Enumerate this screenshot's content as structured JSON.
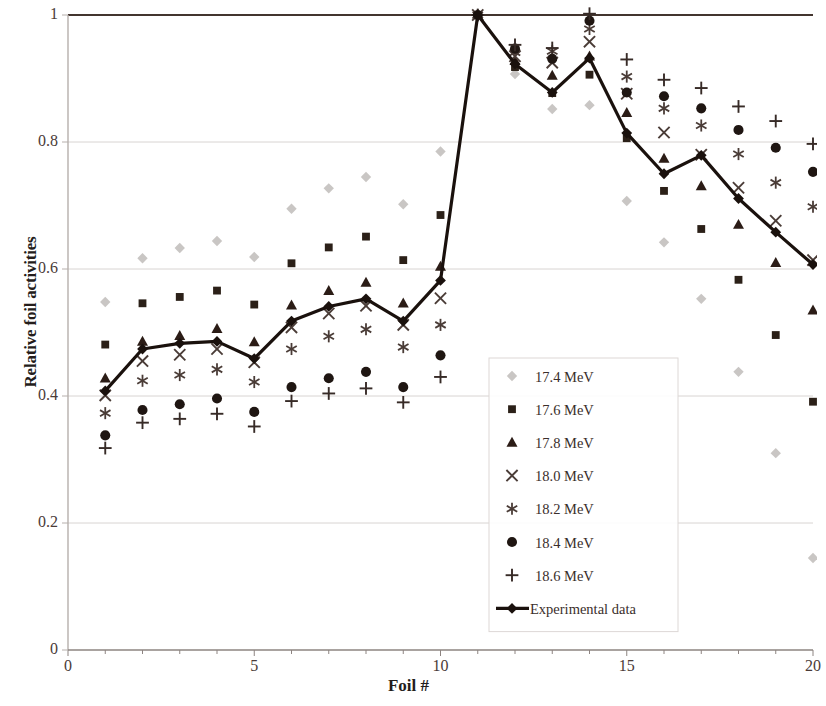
{
  "chart_data": {
    "type": "scatter",
    "title": "",
    "xlabel": "Foil #",
    "ylabel": "Relative foil activities",
    "xlim": [
      0,
      20
    ],
    "ylim": [
      0,
      1
    ],
    "xticks": [
      0,
      5,
      10,
      15,
      20
    ],
    "yticks": [
      0,
      0.2,
      0.4,
      0.6,
      0.8,
      1
    ],
    "xtick_labels": [
      "0",
      "5",
      "10",
      "15",
      "20"
    ],
    "ytick_labels": [
      "0",
      "0.2",
      "0.4",
      "0.6",
      "0.8",
      "1"
    ],
    "grid": true,
    "grid_axis": "y",
    "legend_position": "center-right-inside",
    "x": [
      1,
      2,
      3,
      4,
      5,
      6,
      7,
      8,
      9,
      10,
      11,
      12,
      13,
      14,
      15,
      16,
      17,
      18,
      19,
      20
    ],
    "series": [
      {
        "name": "17.4 MeV",
        "marker": "diamond",
        "color": "#c9c6c4",
        "values": [
          0.548,
          0.617,
          0.633,
          0.644,
          0.619,
          0.695,
          0.727,
          0.745,
          0.702,
          0.785,
          1.0,
          0.907,
          0.852,
          0.858,
          0.707,
          0.642,
          0.553,
          0.438,
          0.31,
          0.145
        ]
      },
      {
        "name": "17.6 MeV",
        "marker": "square",
        "color": "#2b2018",
        "values": [
          0.481,
          0.546,
          0.556,
          0.566,
          0.544,
          0.609,
          0.634,
          0.651,
          0.614,
          0.685,
          1.0,
          0.918,
          0.877,
          0.906,
          0.806,
          0.723,
          0.663,
          0.583,
          0.496,
          0.391
        ]
      },
      {
        "name": "17.8 MeV",
        "marker": "triangle",
        "color": "#2b1c16",
        "values": [
          0.428,
          0.486,
          0.495,
          0.506,
          0.485,
          0.543,
          0.566,
          0.579,
          0.546,
          0.604,
          1.0,
          0.928,
          0.905,
          0.935,
          0.846,
          0.774,
          0.731,
          0.67,
          0.61,
          0.535
        ]
      },
      {
        "name": "18.0 MeV",
        "marker": "cross",
        "color": "#4a3c37",
        "values": [
          0.401,
          0.455,
          0.465,
          0.474,
          0.453,
          0.508,
          0.53,
          0.542,
          0.512,
          0.554,
          1.0,
          0.935,
          0.925,
          0.958,
          0.876,
          0.815,
          0.78,
          0.728,
          0.676,
          0.614
        ]
      },
      {
        "name": "18.2 MeV",
        "marker": "asterisk",
        "color": "#4a3c37",
        "values": [
          0.373,
          0.424,
          0.433,
          0.442,
          0.422,
          0.474,
          0.494,
          0.505,
          0.477,
          0.512,
          1.0,
          0.941,
          0.943,
          0.978,
          0.903,
          0.853,
          0.826,
          0.781,
          0.736,
          0.698
        ]
      },
      {
        "name": "18.4 MeV",
        "marker": "circle",
        "color": "#1f1612",
        "values": [
          0.338,
          0.378,
          0.387,
          0.396,
          0.375,
          0.414,
          0.428,
          0.438,
          0.414,
          0.464,
          1.0,
          0.947,
          0.931,
          0.991,
          0.878,
          0.872,
          0.853,
          0.819,
          0.791,
          0.753
        ]
      },
      {
        "name": "18.6 MeV",
        "marker": "plus",
        "color": "#372b27",
        "values": [
          0.318,
          0.358,
          0.364,
          0.372,
          0.352,
          0.392,
          0.404,
          0.412,
          0.39,
          0.43,
          1.0,
          0.953,
          0.948,
          1.002,
          0.93,
          0.898,
          0.885,
          0.856,
          0.833,
          0.797
        ]
      },
      {
        "name": "Experimental data",
        "marker": "line-diamond",
        "color": "#1a110d",
        "values": [
          0.408,
          0.474,
          0.483,
          0.486,
          0.459,
          0.518,
          0.541,
          0.553,
          0.518,
          0.582,
          1.0,
          0.923,
          0.878,
          0.932,
          0.814,
          0.75,
          0.779,
          0.711,
          0.658,
          0.607
        ]
      }
    ],
    "legend_entries": [
      {
        "label": "17.4 MeV",
        "marker": "diamond",
        "color": "#c9c6c4"
      },
      {
        "label": "17.6 MeV",
        "marker": "square",
        "color": "#2b2018"
      },
      {
        "label": "17.8 MeV",
        "marker": "triangle",
        "color": "#2b1c16"
      },
      {
        "label": "18.0 MeV",
        "marker": "cross",
        "color": "#4a3c37"
      },
      {
        "label": "18.2 MeV",
        "marker": "asterisk",
        "color": "#4a3c37"
      },
      {
        "label": "18.4 MeV",
        "marker": "circle",
        "color": "#1f1612"
      },
      {
        "label": "18.6 MeV",
        "marker": "plus",
        "color": "#372b27"
      },
      {
        "label": "Experimental data",
        "marker": "line-diamond",
        "color": "#1a110d"
      }
    ]
  }
}
